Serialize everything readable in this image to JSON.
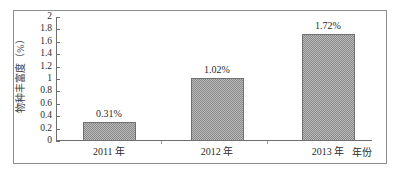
{
  "chart_data": {
    "type": "bar",
    "title": "",
    "xlabel": "年份",
    "ylabel": "物种丰富度（%）",
    "categories": [
      "2011 年",
      "2012 年",
      "2013 年"
    ],
    "values": [
      0.31,
      1.02,
      1.72
    ],
    "value_labels": [
      "0.31%",
      "1.02%",
      "1.72%"
    ],
    "ylim": [
      0,
      2
    ],
    "y_ticks": [
      "0",
      "0.2",
      "0.4",
      "0.6",
      "0.8",
      "1",
      "1.2",
      "1.4",
      "1.6",
      "1.8",
      "2"
    ],
    "y_tick_values": [
      0,
      0.2,
      0.4,
      0.6,
      0.8,
      1,
      1.2,
      1.4,
      1.6,
      1.8,
      2
    ],
    "grid": false,
    "legend": "none",
    "bar_fill": "#b9b9b9",
    "bar_border": "#707070",
    "axis_color": "#6f6f6f",
    "frame_color": "#8d8d8d"
  }
}
